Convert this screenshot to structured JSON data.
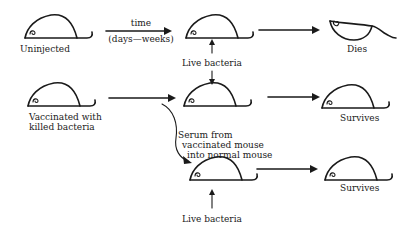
{
  "diagram": {
    "rows": [
      {
        "id": "uninjected",
        "start_label": "Uninjected",
        "arrow_label_top": "time",
        "arrow_label_bottom": "(days—weeks)",
        "challenge_label": "Live bacteria",
        "outcome_label": "Dies"
      },
      {
        "id": "vaccinated",
        "start_label_line1": "Vaccinated with",
        "start_label_line2": "killed bacteria",
        "outcome_label": "Survives"
      },
      {
        "id": "serum-transfer",
        "transfer_label_line1": "Serum from",
        "transfer_label_line2": "vaccinated mouse",
        "transfer_label_line3": "into normal mouse",
        "challenge_label": "Live bacteria",
        "outcome_label": "Survives"
      }
    ],
    "icons": {
      "mouse": "mouse-icon",
      "dead_mouse": "dead-mouse-icon",
      "arrow": "arrow-right-icon"
    }
  }
}
